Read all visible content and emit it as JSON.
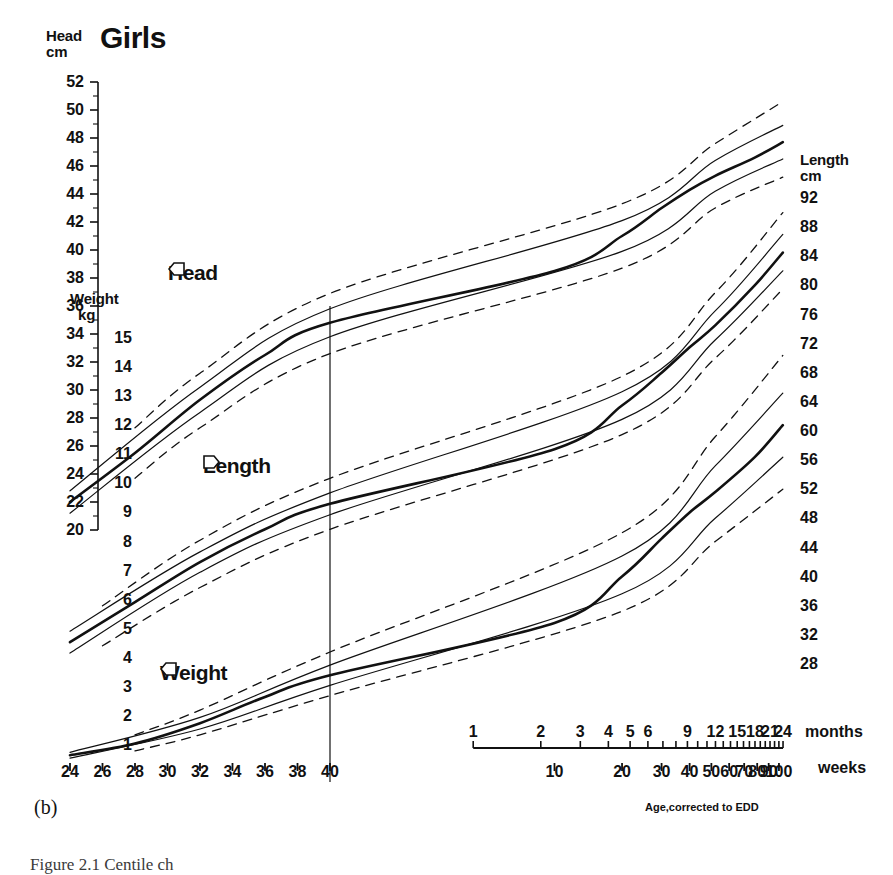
{
  "title": "Girls",
  "panel_letter": "(b)",
  "caption": "Figure 2.1  Centile ch",
  "footnote": "Age,corrected to EDD",
  "colors": {
    "ink": "#111111",
    "line": "#1a1a1a",
    "paper": "#ffffff"
  },
  "axes": {
    "head": {
      "title_line1": "Head",
      "title_line2": "cm",
      "ticks": [
        52,
        50,
        48,
        46,
        44,
        42,
        40,
        38,
        36,
        34,
        32,
        30,
        28,
        26,
        24,
        22,
        20
      ],
      "minor_between": true,
      "min": 20,
      "max": 52
    },
    "weight": {
      "title_line1": "Weight",
      "title_line2": "kg",
      "ticks": [
        15,
        14,
        13,
        12,
        11,
        10,
        9,
        8,
        7,
        6,
        5,
        4,
        3,
        2,
        1
      ],
      "min": 1,
      "max": 15
    },
    "length": {
      "title_line1": "Length",
      "title_line2": "cm",
      "ticks": [
        92,
        88,
        84,
        80,
        76,
        72,
        68,
        64,
        60,
        56,
        52,
        48,
        44,
        40,
        36,
        32,
        28
      ],
      "min": 28,
      "max": 92
    },
    "gestation_weeks": {
      "unit": "weeks",
      "ticks": [
        24,
        26,
        28,
        30,
        32,
        34,
        36,
        38,
        40
      ]
    },
    "postnatal_weeks": {
      "unit": "weeks",
      "ticks": [
        10,
        20,
        30,
        40,
        50,
        60,
        70,
        80,
        90,
        100
      ]
    },
    "months": {
      "unit": "months",
      "ticks": [
        1,
        2,
        3,
        4,
        5,
        6,
        9,
        12,
        15,
        18,
        21,
        24
      ]
    }
  },
  "curve_labels": {
    "head": "Head",
    "length": "Length",
    "weight": "Weight"
  },
  "chart_data": {
    "type": "line",
    "title": "Girls",
    "subtitle": "Centile chart for head circumference, length and weight",
    "xlabel": "Age, corrected to EDD",
    "ylabel": "Head cm / Weight kg / Length cm",
    "grid": false,
    "legend": "inline-arrow-labels",
    "x_axes": [
      {
        "name": "gestational age",
        "unit": "weeks",
        "range": [
          24,
          40
        ],
        "ticks": [
          24,
          26,
          28,
          30,
          32,
          34,
          36,
          38,
          40
        ],
        "scale": "linear"
      },
      {
        "name": "postnatal age",
        "unit": "weeks",
        "range": [
          1,
          104
        ],
        "ticks": [
          10,
          20,
          30,
          40,
          50,
          60,
          70,
          80,
          90,
          100
        ],
        "scale": "log"
      },
      {
        "name": "postnatal age",
        "unit": "months",
        "range": [
          1,
          24
        ],
        "ticks": [
          1,
          2,
          3,
          4,
          5,
          6,
          9,
          12,
          15,
          18,
          21,
          24
        ],
        "scale": "log"
      }
    ],
    "y_axes": [
      {
        "name": "Head circumference",
        "unit": "cm",
        "side": "left-outer",
        "range": [
          20,
          52
        ],
        "tick_step": 2
      },
      {
        "name": "Weight",
        "unit": "kg",
        "side": "left-inner",
        "range": [
          1,
          15
        ],
        "tick_step": 1
      },
      {
        "name": "Length",
        "unit": "cm",
        "side": "right",
        "range": [
          28,
          92
        ],
        "tick_step": 4
      }
    ],
    "reference_line": {
      "label": "40 weeks / EDD",
      "x_weeks": 40,
      "style": "solid thin vertical"
    },
    "centile_styles": {
      "thick_solid": "50th centile",
      "thin_solid": "25th and 75th centile",
      "dashed": "3rd(2nd) and 97th(98th) centile"
    },
    "series": [
      {
        "name": "Head circumference 50th centile",
        "measure": "head",
        "centile": 50,
        "unit": "cm",
        "style": "thick-solid",
        "points": [
          {
            "x_label": "24 wk gest",
            "y": 22.0
          },
          {
            "x_label": "28 wk gest",
            "y": 25.5
          },
          {
            "x_label": "32 wk gest",
            "y": 29.3
          },
          {
            "x_label": "36 wk gest",
            "y": 32.5
          },
          {
            "x_label": "40 wk gest (birth)",
            "y": 34.8
          },
          {
            "x_label": "10 wk",
            "y": 38.5
          },
          {
            "x_label": "20 wk",
            "y": 41.0
          },
          {
            "x_label": "30 wk",
            "y": 43.0
          },
          {
            "x_label": "40 wk",
            "y": 44.3
          },
          {
            "x_label": "52 wk (12 mo)",
            "y": 45.3
          },
          {
            "x_label": "78 wk (18 mo)",
            "y": 46.6
          },
          {
            "x_label": "104 wk (24 mo)",
            "y": 47.7
          }
        ]
      },
      {
        "name": "Head circumference 75th centile",
        "measure": "head",
        "centile": 75,
        "unit": "cm",
        "style": "thin-solid",
        "points": [
          {
            "x_label": "24 wk gest",
            "y": 22.8
          },
          {
            "x_label": "32 wk gest",
            "y": 30.2
          },
          {
            "x_label": "40 wk gest (birth)",
            "y": 35.8
          },
          {
            "x_label": "20 wk",
            "y": 42.1
          },
          {
            "x_label": "52 wk (12 mo)",
            "y": 46.4
          },
          {
            "x_label": "104 wk (24 mo)",
            "y": 48.9
          }
        ]
      },
      {
        "name": "Head circumference 25th centile",
        "measure": "head",
        "centile": 25,
        "unit": "cm",
        "style": "thin-solid",
        "points": [
          {
            "x_label": "24 wk gest",
            "y": 21.2
          },
          {
            "x_label": "32 wk gest",
            "y": 28.4
          },
          {
            "x_label": "40 wk gest (birth)",
            "y": 33.8
          },
          {
            "x_label": "20 wk",
            "y": 39.9
          },
          {
            "x_label": "52 wk (12 mo)",
            "y": 44.2
          },
          {
            "x_label": "104 wk (24 mo)",
            "y": 46.5
          }
        ]
      },
      {
        "name": "Head circumference 97th centile",
        "measure": "head",
        "centile": 97,
        "unit": "cm",
        "style": "dashed",
        "points": [
          {
            "x_label": "28 wk gest",
            "y": 27.3
          },
          {
            "x_label": "32 wk gest",
            "y": 31.2
          },
          {
            "x_label": "40 wk gest (birth)",
            "y": 36.9
          },
          {
            "x_label": "20 wk",
            "y": 43.3
          },
          {
            "x_label": "52 wk (12 mo)",
            "y": 47.6
          },
          {
            "x_label": "104 wk (24 mo)",
            "y": 50.6
          }
        ]
      },
      {
        "name": "Head circumference 3rd centile",
        "measure": "head",
        "centile": 3,
        "unit": "cm",
        "style": "dashed",
        "points": [
          {
            "x_label": "28 wk gest",
            "y": 23.7
          },
          {
            "x_label": "32 wk gest",
            "y": 27.3
          },
          {
            "x_label": "40 wk gest (birth)",
            "y": 32.6
          },
          {
            "x_label": "20 wk",
            "y": 38.7
          },
          {
            "x_label": "52 wk (12 mo)",
            "y": 43.0
          },
          {
            "x_label": "104 wk (24 mo)",
            "y": 45.2
          }
        ]
      },
      {
        "name": "Length 50th centile",
        "measure": "length",
        "centile": 50,
        "unit": "cm",
        "style": "thick-solid",
        "points": [
          {
            "x_label": "24 wk gest",
            "y": 31.0
          },
          {
            "x_label": "28 wk gest",
            "y": 36.5
          },
          {
            "x_label": "32 wk gest",
            "y": 42.0
          },
          {
            "x_label": "36 wk gest",
            "y": 46.5
          },
          {
            "x_label": "40 wk gest (birth)",
            "y": 50.0
          },
          {
            "x_label": "10 wk",
            "y": 57.5
          },
          {
            "x_label": "20 wk",
            "y": 63.5
          },
          {
            "x_label": "30 wk",
            "y": 68.0
          },
          {
            "x_label": "40 wk",
            "y": 71.5
          },
          {
            "x_label": "52 wk (12 mo)",
            "y": 74.5
          },
          {
            "x_label": "78 wk (18 mo)",
            "y": 80.0
          },
          {
            "x_label": "104 wk (24 mo)",
            "y": 84.5
          }
        ]
      },
      {
        "name": "Length 75th centile",
        "measure": "length",
        "centile": 75,
        "unit": "cm",
        "style": "thin-solid",
        "points": [
          {
            "x_label": "24 wk gest",
            "y": 32.5
          },
          {
            "x_label": "32 wk gest",
            "y": 43.4
          },
          {
            "x_label": "40 wk gest (birth)",
            "y": 51.5
          },
          {
            "x_label": "20 wk",
            "y": 65.4
          },
          {
            "x_label": "52 wk (12 mo)",
            "y": 76.5
          },
          {
            "x_label": "104 wk (24 mo)",
            "y": 87.0
          }
        ]
      },
      {
        "name": "Length 25th centile",
        "measure": "length",
        "centile": 25,
        "unit": "cm",
        "style": "thin-solid",
        "points": [
          {
            "x_label": "24 wk gest",
            "y": 29.5
          },
          {
            "x_label": "32 wk gest",
            "y": 40.6
          },
          {
            "x_label": "40 wk gest (birth)",
            "y": 48.5
          },
          {
            "x_label": "20 wk",
            "y": 61.6
          },
          {
            "x_label": "52 wk (12 mo)",
            "y": 72.5
          },
          {
            "x_label": "104 wk (24 mo)",
            "y": 82.0
          }
        ]
      },
      {
        "name": "Length 97th centile",
        "measure": "length",
        "centile": 97,
        "unit": "cm",
        "style": "dashed",
        "points": [
          {
            "x_label": "26 wk gest",
            "y": 36.0
          },
          {
            "x_label": "32 wk gest",
            "y": 45.0
          },
          {
            "x_label": "40 wk gest (birth)",
            "y": 53.5
          },
          {
            "x_label": "20 wk",
            "y": 67.5
          },
          {
            "x_label": "52 wk (12 mo)",
            "y": 79.0
          },
          {
            "x_label": "104 wk (24 mo)",
            "y": 90.0
          }
        ]
      },
      {
        "name": "Length 3rd centile",
        "measure": "length",
        "centile": 3,
        "unit": "cm",
        "style": "dashed",
        "points": [
          {
            "x_label": "26 wk gest",
            "y": 30.5
          },
          {
            "x_label": "32 wk gest",
            "y": 38.5
          },
          {
            "x_label": "40 wk gest (birth)",
            "y": 46.5
          },
          {
            "x_label": "20 wk",
            "y": 59.5
          },
          {
            "x_label": "52 wk (12 mo)",
            "y": 70.0
          },
          {
            "x_label": "104 wk (24 mo)",
            "y": 79.5
          }
        ]
      },
      {
        "name": "Weight 50th centile",
        "measure": "weight",
        "centile": 50,
        "unit": "kg",
        "style": "thick-solid",
        "points": [
          {
            "x_label": "24 wk gest",
            "y": 0.65
          },
          {
            "x_label": "28 wk gest",
            "y": 1.05
          },
          {
            "x_label": "32 wk gest",
            "y": 1.75
          },
          {
            "x_label": "36 wk gest",
            "y": 2.65
          },
          {
            "x_label": "40 wk gest (birth)",
            "y": 3.4
          },
          {
            "x_label": "10 wk",
            "y": 5.2
          },
          {
            "x_label": "20 wk",
            "y": 6.8
          },
          {
            "x_label": "30 wk",
            "y": 8.1
          },
          {
            "x_label": "40 wk",
            "y": 9.0
          },
          {
            "x_label": "52 wk (12 mo)",
            "y": 9.7
          },
          {
            "x_label": "78 wk (18 mo)",
            "y": 10.9
          },
          {
            "x_label": "104 wk (24 mo)",
            "y": 12.0
          }
        ]
      },
      {
        "name": "Weight 75th centile",
        "measure": "weight",
        "centile": 75,
        "unit": "kg",
        "style": "thin-solid",
        "points": [
          {
            "x_label": "24 wk gest",
            "y": 0.75
          },
          {
            "x_label": "32 wk gest",
            "y": 1.95
          },
          {
            "x_label": "40 wk gest (birth)",
            "y": 3.75
          },
          {
            "x_label": "20 wk",
            "y": 7.5
          },
          {
            "x_label": "52 wk (12 mo)",
            "y": 10.6
          },
          {
            "x_label": "104 wk (24 mo)",
            "y": 13.1
          }
        ]
      },
      {
        "name": "Weight 25th centile",
        "measure": "weight",
        "centile": 25,
        "unit": "kg",
        "style": "thin-solid",
        "points": [
          {
            "x_label": "24 wk gest",
            "y": 0.55
          },
          {
            "x_label": "32 wk gest",
            "y": 1.55
          },
          {
            "x_label": "40 wk gest (birth)",
            "y": 3.05
          },
          {
            "x_label": "20 wk",
            "y": 6.2
          },
          {
            "x_label": "52 wk (12 mo)",
            "y": 8.8
          },
          {
            "x_label": "104 wk (24 mo)",
            "y": 10.9
          }
        ]
      },
      {
        "name": "Weight 97th centile",
        "measure": "weight",
        "centile": 97,
        "unit": "kg",
        "style": "dashed",
        "points": [
          {
            "x_label": "28 wk gest",
            "y": 1.35
          },
          {
            "x_label": "32 wk gest",
            "y": 2.2
          },
          {
            "x_label": "40 wk gest (birth)",
            "y": 4.2
          },
          {
            "x_label": "20 wk",
            "y": 8.3
          },
          {
            "x_label": "52 wk (12 mo)",
            "y": 11.6
          },
          {
            "x_label": "104 wk (24 mo)",
            "y": 14.4
          }
        ]
      },
      {
        "name": "Weight 3rd centile",
        "measure": "weight",
        "centile": 3,
        "unit": "kg",
        "style": "dashed",
        "points": [
          {
            "x_label": "28 wk gest",
            "y": 0.8
          },
          {
            "x_label": "32 wk gest",
            "y": 1.35
          },
          {
            "x_label": "40 wk gest (birth)",
            "y": 2.7
          },
          {
            "x_label": "20 wk",
            "y": 5.6
          },
          {
            "x_label": "52 wk (12 mo)",
            "y": 8.0
          },
          {
            "x_label": "104 wk (24 mo)",
            "y": 9.8
          }
        ]
      }
    ]
  }
}
